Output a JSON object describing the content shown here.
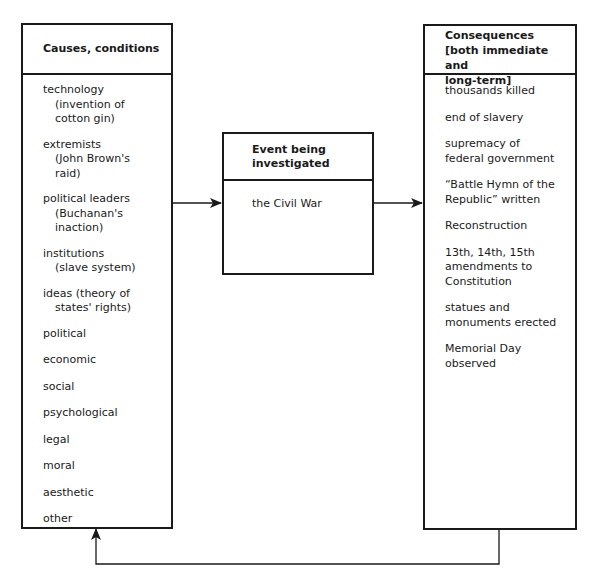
{
  "causes": {
    "title": "Causes, conditions",
    "items": [
      {
        "label": "technology",
        "sub": [
          "(invention of",
          "cotton gin)"
        ]
      },
      {
        "label": "extremists",
        "sub": [
          "(John Brown's",
          "raid)"
        ]
      },
      {
        "label": "political leaders",
        "sub": [
          "(Buchanan's",
          "inaction)"
        ]
      },
      {
        "label": "institutions",
        "sub": [
          "(slave system)"
        ]
      },
      {
        "label": "ideas (theory of",
        "sub": [
          "states' rights)"
        ]
      },
      {
        "label": "political",
        "sub": []
      },
      {
        "label": "economic",
        "sub": []
      },
      {
        "label": "social",
        "sub": []
      },
      {
        "label": "psychological",
        "sub": []
      },
      {
        "label": "legal",
        "sub": []
      },
      {
        "label": "moral",
        "sub": []
      },
      {
        "label": "aesthetic",
        "sub": []
      },
      {
        "label": "other",
        "sub": []
      }
    ]
  },
  "event": {
    "title_line1": "Event being",
    "title_line2": "investigated",
    "value": "the Civil War"
  },
  "consequences": {
    "title_line1": "Consequences",
    "title_line2": "[both immediate and",
    "title_line3": "long-term]",
    "items": [
      {
        "lines": [
          "thousands killed"
        ]
      },
      {
        "lines": [
          "end of slavery"
        ]
      },
      {
        "lines": [
          "supremacy of",
          "federal government"
        ]
      },
      {
        "lines": [
          "“Battle Hymn of the",
          "Republic” written"
        ]
      },
      {
        "lines": [
          "Reconstruction"
        ]
      },
      {
        "lines": [
          "13th, 14th, 15th",
          "amendments to",
          "Constitution"
        ]
      },
      {
        "lines": [
          "statues and",
          "monuments erected"
        ]
      },
      {
        "lines": [
          "Memorial Day",
          "observed"
        ]
      }
    ]
  },
  "arrows": [
    {
      "from": "causes",
      "to": "event"
    },
    {
      "from": "event",
      "to": "consequences"
    },
    {
      "from": "consequences",
      "to": "causes",
      "type": "feedback-loop"
    }
  ]
}
